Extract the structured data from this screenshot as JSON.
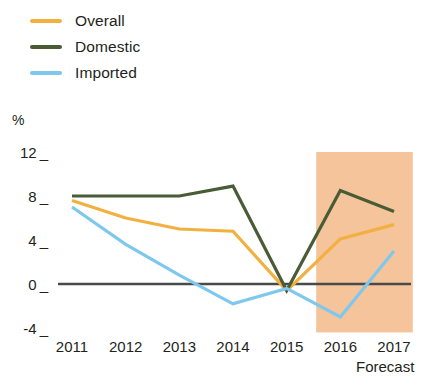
{
  "chart_data": {
    "type": "line",
    "title": "",
    "subtitle": "",
    "xlabel": "",
    "ylabel": "%",
    "categories": [
      "2011",
      "2012",
      "2013",
      "2014",
      "2015",
      "2016",
      "2017"
    ],
    "x": [
      2011,
      2012,
      2013,
      2014,
      2015,
      2016,
      2017
    ],
    "ylim": [
      -4,
      12
    ],
    "yticks": [
      12,
      8,
      4,
      0,
      -4
    ],
    "ytick_labels": [
      "12",
      "8",
      "4",
      "0",
      "-4"
    ],
    "grid": false,
    "legend_position": "top-left",
    "zero_line": 0,
    "annotations": [
      {
        "text": "Forecast",
        "x_range": [
          "2016",
          "2017"
        ],
        "type": "shaded-region-label"
      }
    ],
    "shaded_region": {
      "label": "Forecast",
      "from": 2015.55,
      "to": 2017.35,
      "color": "#f5c49a"
    },
    "series": [
      {
        "name": "Overall",
        "color": "#f2b040",
        "values": [
          7.6,
          6.0,
          5.0,
          4.8,
          -0.6,
          4.1,
          5.4
        ]
      },
      {
        "name": "Domestic",
        "color": "#4a5c36",
        "values": [
          8.0,
          8.0,
          8.0,
          8.9,
          -0.6,
          8.5,
          6.6
        ]
      },
      {
        "name": "Imported",
        "color": "#7ec8ee",
        "values": [
          7.0,
          3.6,
          0.8,
          -1.8,
          -0.4,
          -3.0,
          3.0
        ]
      }
    ]
  },
  "legend": {
    "items": [
      {
        "label": "Overall",
        "color": "#f2b040"
      },
      {
        "label": "Domestic",
        "color": "#4a5c36"
      },
      {
        "label": "Imported",
        "color": "#7ec8ee"
      }
    ]
  },
  "axes": {
    "y_unit": "%",
    "y_ticks": [
      "12",
      "8",
      "4",
      "0",
      "-4"
    ],
    "x_ticks": [
      "2011",
      "2012",
      "2013",
      "2014",
      "2015",
      "2016",
      "2017"
    ]
  },
  "labels": {
    "forecast": "Forecast"
  },
  "colors": {
    "overall": "#f2b040",
    "domestic": "#4a5c36",
    "imported": "#7ec8ee",
    "forecast_band": "#f5c49a",
    "axis": "#231f20",
    "zero_line": "#4a4a4a"
  }
}
